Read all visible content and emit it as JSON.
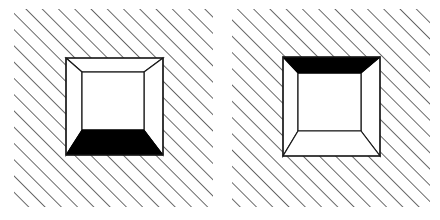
{
  "figure": {
    "canvas": {
      "width": 440,
      "height": 220,
      "background": "#ffffff"
    },
    "colors": {
      "ink": "#1a1a1a",
      "hatch": "#2b2b2b",
      "fill_black": "#000000",
      "fill_white": "#ffffff",
      "background": "#ffffff"
    },
    "hatching": {
      "angle_label": "45 degrees up-right",
      "spacing_px": 11.5,
      "stroke_width_px": 1.4,
      "color": "#2b2b2b"
    },
    "panels": [
      {
        "id": "left",
        "name": "left-panel",
        "label": "Box with black floor",
        "hatch_rect": {
          "x": 14,
          "y": 9,
          "width": 199,
          "height": 198
        },
        "box": {
          "outer": {
            "x": 66,
            "y": 58,
            "width": 97,
            "height": 97
          },
          "inner": {
            "x": 82,
            "y": 72,
            "width": 62,
            "height": 58
          },
          "black_face": "floor",
          "black_face_label": "bottom face (floor) filled black",
          "white_faces": [
            "ceiling",
            "left wall",
            "right wall",
            "back wall"
          ]
        }
      },
      {
        "id": "right",
        "name": "right-panel",
        "label": "Box with black ceiling",
        "hatch_rect": {
          "x": 232,
          "y": 9,
          "width": 198,
          "height": 198
        },
        "box": {
          "outer": {
            "x": 283,
            "y": 57,
            "width": 97,
            "height": 99
          },
          "inner": {
            "x": 298,
            "y": 73,
            "width": 63,
            "height": 58
          },
          "black_face": "ceiling",
          "black_face_label": "top face (ceiling) filled black",
          "white_faces": [
            "floor",
            "left wall",
            "right wall",
            "back wall"
          ]
        }
      }
    ]
  }
}
